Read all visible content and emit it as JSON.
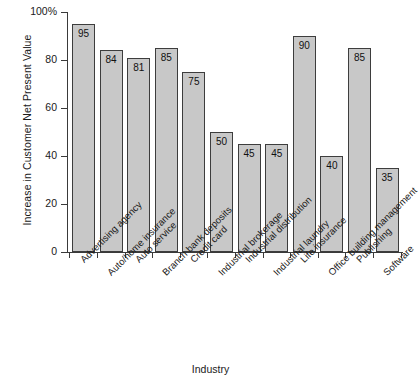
{
  "chart_data": {
    "type": "bar",
    "title": "",
    "xlabel": "Industry",
    "ylabel": "Increase in Customer Net Present Value",
    "ylim": [
      0,
      100
    ],
    "yticks": [
      0,
      20,
      40,
      60,
      80,
      100
    ],
    "ytick_labels": [
      "0",
      "20",
      "40",
      "60",
      "80",
      "100%"
    ],
    "grid": false,
    "legend": "none",
    "bar_color": "#c8c8c8",
    "bar_edge_color": "#3d3d3d",
    "axis_color": "#3a3a3a",
    "categories": [
      "Advertising agency",
      "Auto/home insurance",
      "Auto service",
      "Branch bank deposits",
      "Credit card",
      "Industrial brokerage",
      "Industrial distribution",
      "Industrial laundry",
      "Life insurance",
      "Office building management",
      "Publishing",
      "Software"
    ],
    "values": [
      95,
      84,
      81,
      85,
      75,
      50,
      45,
      45,
      90,
      40,
      85,
      35
    ],
    "value_labels": [
      "95",
      "84",
      "81",
      "85",
      "75",
      "50",
      "45",
      "45",
      "90",
      "40",
      "85",
      "35"
    ]
  }
}
